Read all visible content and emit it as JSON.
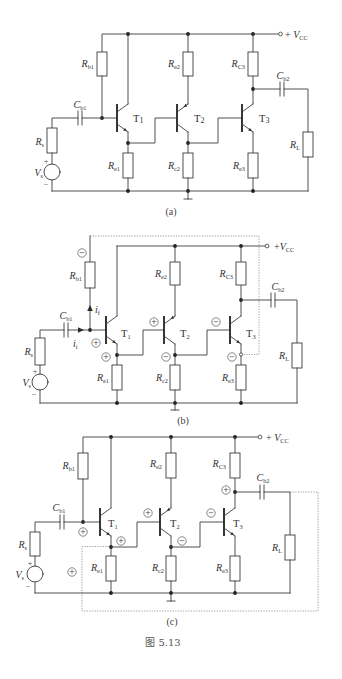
{
  "colors": {
    "background": "#ffffff",
    "wire": "#3c3c3c",
    "feedback_path": "#8a8a8a"
  },
  "figure": {
    "caption": "图 5.13"
  },
  "panels": {
    "a": {
      "label": "(a)",
      "vcc": {
        "prefix": "+ ",
        "main": "V",
        "sub": "CC"
      },
      "rb1": {
        "main": "R",
        "sub": "b1"
      },
      "re2": {
        "main": "R",
        "sub": "e2"
      },
      "rc3": {
        "main": "R",
        "sub": "C3"
      },
      "cb1": {
        "main": "C",
        "sub": "b1"
      },
      "cb2": {
        "main": "C",
        "sub": "b2"
      },
      "rs": {
        "main": "R",
        "sub": "s"
      },
      "vs": {
        "main": "V",
        "sub": "s"
      },
      "vs_plus": "+",
      "vs_minus": "−",
      "re1": {
        "main": "R",
        "sub": "e1"
      },
      "rc2": {
        "main": "R",
        "sub": "c2"
      },
      "re3": {
        "main": "R",
        "sub": "e3"
      },
      "rl": {
        "main": "R",
        "sub": "L"
      },
      "t1": {
        "main": "T",
        "sub": "1"
      },
      "t2": {
        "main": "T",
        "sub": "2"
      },
      "t3": {
        "main": "T",
        "sub": "3"
      }
    },
    "b": {
      "label": "(b)",
      "vcc": {
        "prefix": "+",
        "main": "V",
        "sub": "CC"
      },
      "rb1": {
        "main": "R",
        "sub": "b1"
      },
      "re2": {
        "main": "R",
        "sub": "e2"
      },
      "rc3": {
        "main": "R",
        "sub": "C3"
      },
      "cb1": {
        "main": "C",
        "sub": "b1"
      },
      "cb2": {
        "main": "C",
        "sub": "b2"
      },
      "rs": {
        "main": "R",
        "sub": "s"
      },
      "vs": {
        "main": "V",
        "sub": "s"
      },
      "vs_plus": "+",
      "vs_minus": "−",
      "re1": {
        "main": "R",
        "sub": "e1"
      },
      "rc2": {
        "main": "R",
        "sub": "c2"
      },
      "re3": {
        "main": "R",
        "sub": "e3"
      },
      "rl": {
        "main": "R",
        "sub": "L"
      },
      "t1": {
        "main": "T",
        "sub": "1"
      },
      "t2": {
        "main": "T",
        "sub": "2"
      },
      "t3": {
        "main": "T",
        "sub": "3"
      },
      "if": {
        "main": "i",
        "sub": "f"
      },
      "ii": {
        "main": "i",
        "sub": "i"
      },
      "polarity": {
        "rb1_top": "−",
        "t1_base": "+",
        "t1_emitter": "+",
        "t2_base": "+",
        "t2_collector": "−",
        "t3_base": "−",
        "t3_emitter": "−"
      }
    },
    "c": {
      "label": "(c)",
      "vcc": {
        "prefix": "+ ",
        "main": "V",
        "sub": "CC"
      },
      "rb1": {
        "main": "R",
        "sub": "b1"
      },
      "re2": {
        "main": "R",
        "sub": "e2"
      },
      "rc3": {
        "main": "R",
        "sub": "C3"
      },
      "cb1": {
        "main": "C",
        "sub": "b1"
      },
      "cb2": {
        "main": "C",
        "sub": "b2"
      },
      "rs": {
        "main": "R",
        "sub": "s"
      },
      "vs": {
        "main": "V",
        "sub": "s"
      },
      "vs_plus": "+",
      "vs_minus": "−",
      "re1": {
        "main": "R",
        "sub": "e1"
      },
      "rc2": {
        "main": "R",
        "sub": "c2"
      },
      "re3": {
        "main": "R",
        "sub": "e3"
      },
      "rl": {
        "main": "R",
        "sub": "L"
      },
      "t1": {
        "main": "T",
        "sub": "1"
      },
      "t2": {
        "main": "T",
        "sub": "2"
      },
      "t3": {
        "main": "T",
        "sub": "3"
      },
      "polarity": {
        "t1_base": "+",
        "t1_emitter": "+",
        "t2_base": "+",
        "t2_collector": "−",
        "t3_base": "−",
        "t3_collector": "+",
        "loop": "+"
      }
    }
  }
}
